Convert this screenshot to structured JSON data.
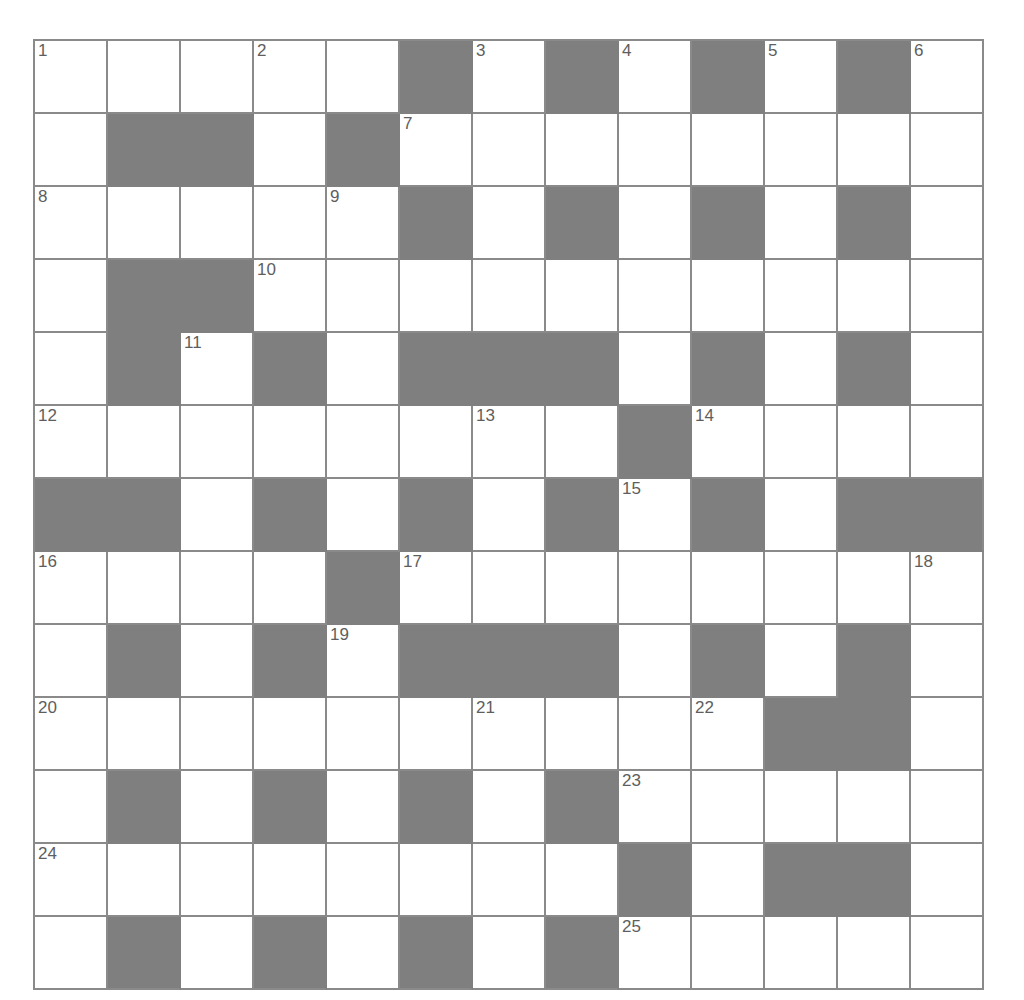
{
  "puzzle": {
    "type": "crossword-grid",
    "rows": 13,
    "columns": 13,
    "cell_size_px": 73,
    "colors": {
      "block_fill": "#7f7f7f",
      "cell_fill": "#ffffff",
      "grid_line": "#8a8a8a",
      "number_text": "#5e5e5e",
      "page_background": "#ffffff"
    },
    "grid": [
      [
        "open",
        "open",
        "open",
        "open",
        "open",
        "block",
        "open",
        "block",
        "open",
        "block",
        "open",
        "block",
        "open"
      ],
      [
        "open",
        "block",
        "block",
        "open",
        "block",
        "open",
        "open",
        "open",
        "open",
        "open",
        "open",
        "open",
        "open"
      ],
      [
        "open",
        "open",
        "open",
        "open",
        "open",
        "block",
        "open",
        "block",
        "open",
        "block",
        "open",
        "block",
        "open"
      ],
      [
        "open",
        "block",
        "block",
        "open",
        "open",
        "open",
        "open",
        "open",
        "open",
        "open",
        "open",
        "open",
        "open"
      ],
      [
        "open",
        "block",
        "open",
        "block",
        "open",
        "block",
        "block",
        "block",
        "open",
        "block",
        "open",
        "block",
        "open"
      ],
      [
        "open",
        "open",
        "open",
        "open",
        "open",
        "open",
        "open",
        "open",
        "block",
        "open",
        "open",
        "open",
        "open"
      ],
      [
        "block",
        "block",
        "open",
        "block",
        "open",
        "block",
        "open",
        "block",
        "open",
        "block",
        "open",
        "block",
        "block"
      ],
      [
        "open",
        "open",
        "open",
        "open",
        "block",
        "open",
        "open",
        "open",
        "open",
        "open",
        "open",
        "open",
        "open"
      ],
      [
        "open",
        "block",
        "open",
        "block",
        "open",
        "block",
        "block",
        "block",
        "open",
        "block",
        "open",
        "block",
        "open"
      ],
      [
        "open",
        "open",
        "open",
        "open",
        "open",
        "open",
        "open",
        "open",
        "open",
        "open",
        "block",
        "block",
        "open"
      ],
      [
        "open",
        "block",
        "open",
        "block",
        "open",
        "block",
        "open",
        "block",
        "open",
        "open",
        "open",
        "open",
        "open"
      ],
      [
        "open",
        "open",
        "open",
        "open",
        "open",
        "open",
        "open",
        "open",
        "block",
        "open",
        "block",
        "block",
        "open"
      ],
      [
        "open",
        "block",
        "open",
        "block",
        "open",
        "block",
        "open",
        "block",
        "open",
        "open",
        "open",
        "open",
        "open"
      ]
    ],
    "numbers": [
      {
        "number": "1",
        "row": 1,
        "col": 1
      },
      {
        "number": "2",
        "row": 1,
        "col": 4
      },
      {
        "number": "3",
        "row": 1,
        "col": 7
      },
      {
        "number": "4",
        "row": 1,
        "col": 9
      },
      {
        "number": "5",
        "row": 1,
        "col": 11
      },
      {
        "number": "6",
        "row": 1,
        "col": 13
      },
      {
        "number": "7",
        "row": 2,
        "col": 6
      },
      {
        "number": "8",
        "row": 3,
        "col": 1
      },
      {
        "number": "9",
        "row": 3,
        "col": 5
      },
      {
        "number": "10",
        "row": 4,
        "col": 4
      },
      {
        "number": "11",
        "row": 5,
        "col": 3
      },
      {
        "number": "12",
        "row": 6,
        "col": 1
      },
      {
        "number": "13",
        "row": 6,
        "col": 7
      },
      {
        "number": "14",
        "row": 6,
        "col": 10
      },
      {
        "number": "15",
        "row": 7,
        "col": 9
      },
      {
        "number": "16",
        "row": 8,
        "col": 1
      },
      {
        "number": "17",
        "row": 8,
        "col": 6
      },
      {
        "number": "18",
        "row": 8,
        "col": 13
      },
      {
        "number": "19",
        "row": 9,
        "col": 5
      },
      {
        "number": "20",
        "row": 10,
        "col": 1
      },
      {
        "number": "21",
        "row": 10,
        "col": 7
      },
      {
        "number": "22",
        "row": 10,
        "col": 10
      },
      {
        "number": "23",
        "row": 11,
        "col": 9
      },
      {
        "number": "24",
        "row": 12,
        "col": 1
      },
      {
        "number": "25",
        "row": 13,
        "col": 9
      }
    ],
    "entries": []
  }
}
